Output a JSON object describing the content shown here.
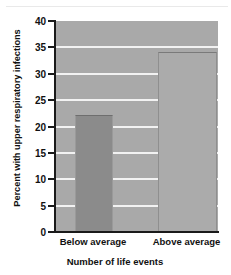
{
  "chart_data": {
    "type": "bar",
    "title": "",
    "categories": [
      "Below average",
      "Above average"
    ],
    "values": [
      22,
      34
    ],
    "xlabel": "Number of life events",
    "ylabel": "Percent with upper respiratory infections",
    "ylim": [
      0,
      40
    ],
    "yticks": [
      0,
      5,
      10,
      15,
      20,
      25,
      30,
      35,
      40
    ],
    "ytick_labels": [
      "0",
      "5",
      "10",
      "15",
      "20",
      "25",
      "30",
      "35",
      "40"
    ],
    "grid": "horizontal",
    "legend": "none",
    "series": [
      {
        "name": "Percent with upper respiratory infections",
        "values": [
          22,
          34
        ]
      }
    ],
    "bar_colors": [
      "#8b8b8b",
      "#ababab"
    ],
    "plot_background": "#a9a9a9",
    "gridline_color": "#f2f2f2",
    "axis_color": "#1a1a1a",
    "figure_background": "#ffffff"
  }
}
